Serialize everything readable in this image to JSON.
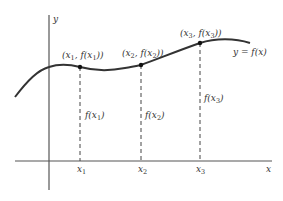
{
  "diagram": {
    "title": "",
    "axes": {
      "x_label": "x",
      "y_label": "y"
    },
    "curve_label": "y = f(x)",
    "points": [
      {
        "name": "x1",
        "x_label": "x",
        "x_sub": "1",
        "coord_label": "(x1, f(x1))",
        "height_label": "f(x1)"
      },
      {
        "name": "x2",
        "x_label": "x",
        "x_sub": "2",
        "coord_label": "(x2, f(x2))",
        "height_label": "f(x2)"
      },
      {
        "name": "x3",
        "x_label": "x",
        "x_sub": "3",
        "coord_label": "(x3, f(x3))",
        "height_label": "f(x3)"
      }
    ],
    "colors": {
      "curve": "#333333",
      "axis": "#555555",
      "dashed": "#444444"
    }
  }
}
